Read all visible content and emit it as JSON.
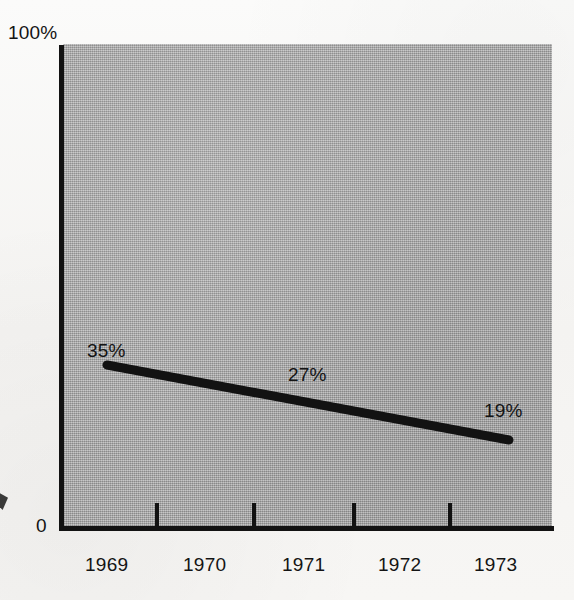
{
  "chart_data": {
    "type": "line",
    "title": "",
    "subtitle": "",
    "xlabel": "",
    "ylabel": "",
    "x": [
      "1969",
      "1970",
      "1971",
      "1972",
      "1973"
    ],
    "categories": [
      "1969",
      "1970",
      "1971",
      "1972",
      "1973"
    ],
    "series": [
      {
        "name": "",
        "values": [
          35,
          null,
          27,
          null,
          19
        ],
        "point_labels": [
          "35%",
          "27%",
          "19%"
        ],
        "labeled_points": [
          {
            "x": "1969",
            "y": 35,
            "label": "35%"
          },
          {
            "x": "1971",
            "y": 27,
            "label": "27%"
          },
          {
            "x": "1973",
            "y": 19,
            "label": "19%"
          }
        ],
        "color": "#121212",
        "line_width_px": 9,
        "line_cap": "round"
      }
    ],
    "ylim": [
      0,
      100
    ],
    "y_tick_labels": [
      "0",
      "100%"
    ],
    "y_axis_top_label": "100%",
    "y_axis_bottom_label": "0",
    "x_tick_labels": [
      "1969",
      "1970",
      "1971",
      "1972",
      "1973"
    ],
    "x_tick_mark_count": 4,
    "x_tick_marks_between_labels": true,
    "grid": false,
    "legend": false,
    "legend_position": "none",
    "plot_background_color": "#a9a9a9",
    "page_background_color": "#f6f5f3",
    "axis_color": "#121212"
  },
  "axes": {
    "y": {
      "top_label": "100%",
      "bottom_label": "0"
    },
    "x": {
      "tick_labels": [
        {
          "text": "1969",
          "left": 85,
          "center": 106
        },
        {
          "text": "1970",
          "left": 183,
          "center": 204
        },
        {
          "text": "1971",
          "left": 282,
          "center": 303
        },
        {
          "text": "1972",
          "left": 378,
          "center": 399
        },
        {
          "text": "1973",
          "left": 474,
          "center": 495
        }
      ],
      "tick_mark_positions": [
        155,
        252,
        352,
        448
      ]
    }
  },
  "line": {
    "start": {
      "x": 107,
      "y": 365
    },
    "end": {
      "x": 509,
      "y": 440
    },
    "color": "#121212",
    "width": 9
  },
  "point_labels": [
    {
      "text": "35%",
      "x": 107,
      "y": 365
    },
    {
      "text": "27%",
      "x": 308,
      "y": 403
    },
    {
      "text": "19%",
      "x": 509,
      "y": 440
    }
  ]
}
